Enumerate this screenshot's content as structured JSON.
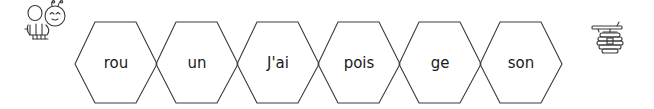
{
  "activity": {
    "start_icon": "bee-icon",
    "end_icon": "beehive-icon",
    "hexagons": [
      {
        "label": "rou"
      },
      {
        "label": "un"
      },
      {
        "label": "J'ai"
      },
      {
        "label": "pois"
      },
      {
        "label": "ge"
      },
      {
        "label": "son"
      }
    ]
  },
  "colors": {
    "stroke": "#3a3a3a",
    "text": "#1a1a1a",
    "background": "#ffffff"
  }
}
